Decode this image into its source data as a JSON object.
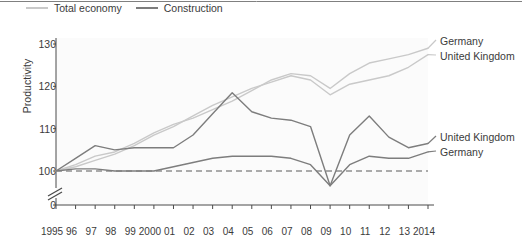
{
  "legend": {
    "items": [
      {
        "label": "Total economy",
        "color": "#c9c9c9",
        "name": "legend-total-economy"
      },
      {
        "label": "Construction",
        "color": "#7d7d7d",
        "name": "legend-construction"
      }
    ]
  },
  "axes": {
    "ylabel": "Productivity",
    "yticks": [
      "130",
      "120",
      "110",
      "100",
      "0"
    ],
    "break_symbol": "axis-break",
    "xticks": [
      "1995",
      "96",
      "97",
      "98",
      "99",
      "2000",
      "01",
      "02",
      "03",
      "04",
      "05",
      "06",
      "07",
      "08",
      "09",
      "10",
      "11",
      "12",
      "13",
      "2014"
    ]
  },
  "end_labels": {
    "top": [
      {
        "text": "Germany",
        "name": "end-label-germany-total"
      },
      {
        "text": "United Kingdom",
        "name": "end-label-uk-total"
      }
    ],
    "bottom": [
      {
        "text": "United Kingdom",
        "name": "end-label-uk-construction"
      },
      {
        "text": "Germany",
        "name": "end-label-germany-construction"
      }
    ]
  },
  "colors": {
    "total_economy": "#c9c9c9",
    "construction": "#7d7d7d",
    "baseline": "#5a5a5a",
    "axis": "#4a4a4a",
    "text": "#3b3b3b"
  },
  "chart_data": {
    "type": "line",
    "title": "",
    "xlabel": "",
    "ylabel": "Productivity",
    "x": [
      1995,
      1996,
      1997,
      1998,
      1999,
      2000,
      2001,
      2002,
      2003,
      2004,
      2005,
      2006,
      2007,
      2008,
      2009,
      2010,
      2011,
      2012,
      2013,
      2014
    ],
    "categories": [
      "1995",
      "96",
      "97",
      "98",
      "99",
      "2000",
      "01",
      "02",
      "03",
      "04",
      "05",
      "06",
      "07",
      "08",
      "09",
      "10",
      "11",
      "12",
      "13",
      "2014"
    ],
    "xlim": [
      1995,
      2014
    ],
    "ylim": [
      100,
      132
    ],
    "ybreak": true,
    "grid": false,
    "legend_position": "top-left",
    "baseline": 100,
    "series": [
      {
        "name": "Germany - Total economy",
        "group": "Total economy",
        "region": "Germany",
        "color": "#c9c9c9",
        "label_side": "right-top",
        "values": [
          100,
          101.5,
          103.5,
          104.5,
          106.5,
          109,
          111,
          112.5,
          114.5,
          116.5,
          119,
          121.5,
          123,
          122.5,
          119.5,
          123,
          125.5,
          126.5,
          127.5,
          129
        ]
      },
      {
        "name": "United Kingdom - Total economy",
        "group": "Total economy",
        "region": "United Kingdom",
        "color": "#c9c9c9",
        "label_side": "right-top",
        "values": [
          100,
          101,
          102.5,
          104,
          106,
          108.5,
          110.5,
          113,
          115.5,
          117.5,
          119.5,
          121,
          122.5,
          121.5,
          118,
          120.5,
          121.5,
          122.5,
          124.5,
          127.5
        ]
      },
      {
        "name": "United Kingdom - Construction",
        "group": "Construction",
        "region": "United Kingdom",
        "color": "#7d7d7d",
        "label_side": "right-bottom",
        "values": [
          100,
          103,
          106,
          105,
          105.5,
          105.5,
          105.5,
          108.5,
          113.5,
          118.5,
          114,
          112.5,
          112,
          110.5,
          96.5,
          108.5,
          113,
          108,
          105.5,
          106.5
        ]
      },
      {
        "name": "Germany - Construction",
        "group": "Construction",
        "region": "Germany",
        "color": "#7d7d7d",
        "label_side": "right-bottom",
        "values": [
          100,
          100.5,
          100.5,
          100,
          100,
          100,
          101,
          102,
          103,
          103.5,
          103.5,
          103.5,
          103,
          101.5,
          96.5,
          101.5,
          103.5,
          103,
          103,
          104.5
        ]
      }
    ]
  }
}
